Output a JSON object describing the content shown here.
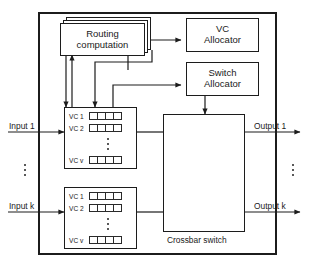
{
  "page": {
    "clipped_header": "",
    "width": 319,
    "height": 269
  },
  "diagram": {
    "outer_label": "router",
    "blocks": {
      "routing": {
        "line1": "Routing",
        "line2": "computation",
        "stacked": true
      },
      "vc_allocator": {
        "line1": "VC",
        "line2": "Allocator"
      },
      "switch_allocator": {
        "line1": "Switch",
        "line2": "Allocator"
      },
      "crossbar": {
        "caption": "Crossbar switch"
      }
    },
    "input_units": [
      {
        "id": "input-1",
        "port_label": "Input 1",
        "vcs": [
          {
            "label": "VC 1",
            "cells": 4
          },
          {
            "label": "VC 2",
            "cells": 4
          },
          {
            "label": "VC v",
            "cells": 4
          }
        ],
        "vc_ellipsis": true
      },
      {
        "id": "input-k",
        "port_label": "Input k",
        "vcs": [
          {
            "label": "VC 1",
            "cells": 4
          },
          {
            "label": "VC 2",
            "cells": 4
          },
          {
            "label": "VC v",
            "cells": 4
          }
        ],
        "vc_ellipsis": true
      }
    ],
    "outputs": [
      {
        "id": "output-1",
        "label": "Output 1"
      },
      {
        "id": "output-k",
        "label": "Output k"
      }
    ],
    "input_ellipsis": true,
    "output_ellipsis": true,
    "colors": {
      "line": "#1c1c1c",
      "background": "#ffffff",
      "text": "#1a1a1a"
    }
  }
}
